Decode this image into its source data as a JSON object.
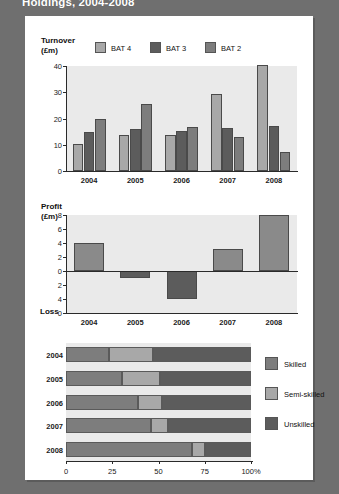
{
  "page": {
    "title": "Holdings, 2004-2008",
    "card_bg": "#ffffff",
    "page_bg": "#6f6f6f"
  },
  "colors": {
    "bat4": "#a8a8a8",
    "bat3": "#5c5c5c",
    "bat2": "#7d7d7d",
    "skilled": "#7d7d7d",
    "semi_skilled": "#a8a8a8",
    "unskilled": "#5c5c5c",
    "profit_bar": "#8a8a8a",
    "loss_bar": "#5c5c5c",
    "plot_bg": "#eaeaea"
  },
  "chart_data": [
    {
      "type": "bar",
      "id": "turnover",
      "title": "Turnover",
      "ylabel": "(£m)",
      "xlabel": "",
      "ylim": [
        0,
        40
      ],
      "yticks": [
        "0",
        "10",
        "20",
        "30",
        "40"
      ],
      "ytick_values": [
        0,
        10,
        20,
        30,
        40
      ],
      "grid": false,
      "legend_position": "top",
      "categories": [
        "2004",
        "2005",
        "2006",
        "2007",
        "2008"
      ],
      "series": [
        {
          "name": "BAT 4",
          "values": [
            10.2,
            13.9,
            13.8,
            29.5,
            40.2
          ]
        },
        {
          "name": "BAT 3",
          "values": [
            15.0,
            16.1,
            15.2,
            16.3,
            17.3
          ]
        },
        {
          "name": "BAT 2",
          "values": [
            19.7,
            25.5,
            16.6,
            13.1,
            7.1
          ]
        }
      ]
    },
    {
      "type": "bar",
      "id": "profit",
      "title": "Profit",
      "ylabel": "(£m)",
      "baseline_label": "Loss",
      "xlabel": "",
      "ylim": [
        -6,
        8
      ],
      "yticks": [
        "8",
        "6",
        "4",
        "2",
        "0",
        "2",
        "4",
        "0"
      ],
      "ytick_values": [
        8,
        6,
        4,
        2,
        0,
        -2,
        -4,
        -6
      ],
      "grid": false,
      "categories": [
        "2004",
        "2005",
        "2006",
        "2007",
        "2008"
      ],
      "values": [
        4.0,
        -1.0,
        -4.0,
        3.2,
        8.0
      ]
    },
    {
      "type": "bar",
      "id": "workforce",
      "orientation": "horizontal",
      "stacked": true,
      "title": "",
      "xlabel": "",
      "xlim": [
        0,
        100
      ],
      "xticks": [
        "0",
        "25",
        "50",
        "75",
        "100%"
      ],
      "xtick_values": [
        0,
        25,
        50,
        75,
        100
      ],
      "legend_position": "right",
      "categories": [
        "2004",
        "2005",
        "2006",
        "2007",
        "2008"
      ],
      "series": [
        {
          "name": "Skilled",
          "values": [
            23,
            30,
            39,
            46,
            68
          ]
        },
        {
          "name": "Semi-skilled",
          "values": [
            24,
            21,
            13,
            9,
            7
          ]
        },
        {
          "name": "Unskilled",
          "values": [
            53,
            49,
            48,
            45,
            25
          ]
        }
      ]
    }
  ]
}
